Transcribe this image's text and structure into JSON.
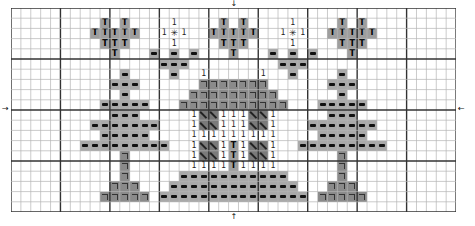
{
  "chart": {
    "cols": 45,
    "rows": 20,
    "cell_width": 9.89,
    "cell_height": 10.2,
    "major_every": 5,
    "center_col": 22,
    "center_row_line": 10,
    "colors": {
      "minor_line": "#b4b4b4",
      "major_line": "#333333",
      "dash_fill": "#a9a9a9",
      "bracket_fill": "#8a8a8a",
      "T_fill": "#9e9e9e",
      "diag_fill": "#7a7a7a"
    },
    "markers": {
      "top_arrow": "↓",
      "bottom_arrow": "↑",
      "left_arrow": "→",
      "right_arrow": "←"
    },
    "legend_symbols": {
      "dash": "−",
      "bracket": "¬",
      "T": "T",
      "diag": "\\",
      "one": "1",
      "star": "✳"
    },
    "stitches": [
      {
        "row": 1,
        "cols": [
          9,
          11
        ],
        "sym": "T"
      },
      {
        "row": 2,
        "cols": [
          8,
          9,
          10,
          11,
          12
        ],
        "sym": "T"
      },
      {
        "row": 3,
        "cols": [
          9,
          10,
          11
        ],
        "sym": "T"
      },
      {
        "row": 4,
        "cols": [
          10
        ],
        "sym": "T"
      },
      {
        "row": 1,
        "cols": [
          21,
          23
        ],
        "sym": "T"
      },
      {
        "row": 2,
        "cols": [
          20,
          21,
          22,
          23,
          24
        ],
        "sym": "T"
      },
      {
        "row": 3,
        "cols": [
          21,
          22,
          23
        ],
        "sym": "T"
      },
      {
        "row": 4,
        "cols": [
          22
        ],
        "sym": "T"
      },
      {
        "row": 1,
        "cols": [
          33,
          35
        ],
        "sym": "T"
      },
      {
        "row": 2,
        "cols": [
          32,
          33,
          34,
          35,
          36
        ],
        "sym": "T"
      },
      {
        "row": 3,
        "cols": [
          33,
          34,
          35
        ],
        "sym": "T"
      },
      {
        "row": 4,
        "cols": [
          34
        ],
        "sym": "T"
      },
      {
        "row": 1,
        "cols": [
          16,
          28
        ],
        "sym": "one"
      },
      {
        "row": 2,
        "cols": [
          15,
          17,
          27,
          29
        ],
        "sym": "one"
      },
      {
        "row": 2,
        "cols": [
          16,
          28
        ],
        "sym": "star"
      },
      {
        "row": 3,
        "cols": [
          16,
          28
        ],
        "sym": "one"
      },
      {
        "row": 4,
        "cols": [
          14,
          16,
          18,
          26,
          28,
          30
        ],
        "sym": "dash"
      },
      {
        "row": 5,
        "cols": [
          15,
          16,
          17,
          27,
          28,
          29
        ],
        "sym": "dash"
      },
      {
        "row": 6,
        "cols": [
          16,
          28
        ],
        "sym": "dash"
      },
      {
        "row": 6,
        "cols": [
          19,
          25
        ],
        "sym": "one"
      },
      {
        "row": 6,
        "cols": [
          11,
          33
        ],
        "sym": "dash"
      },
      {
        "row": 7,
        "cols": [
          10,
          11,
          12,
          32,
          33,
          34
        ],
        "sym": "dash"
      },
      {
        "row": 8,
        "cols": [
          11,
          33
        ],
        "sym": "dash"
      },
      {
        "row": 9,
        "cols": [
          9,
          10,
          11,
          12,
          13,
          31,
          32,
          33,
          34,
          35
        ],
        "sym": "dash"
      },
      {
        "row": 10,
        "cols": [
          10,
          11,
          12,
          32,
          33,
          34
        ],
        "sym": "dash"
      },
      {
        "row": 11,
        "cols": [
          8,
          9,
          10,
          11,
          12,
          13,
          14,
          30,
          31,
          32,
          33,
          34,
          35,
          36
        ],
        "sym": "dash"
      },
      {
        "row": 12,
        "cols": [
          9,
          10,
          11,
          12,
          13,
          31,
          32,
          33,
          34,
          35
        ],
        "sym": "dash"
      },
      {
        "row": 13,
        "cols": [
          7,
          8,
          9,
          10,
          11,
          12,
          13,
          14,
          15,
          29,
          30,
          31,
          32,
          33,
          34,
          35,
          36,
          37
        ],
        "sym": "dash"
      },
      {
        "row": 14,
        "cols": [
          11,
          33
        ],
        "sym": "bracket"
      },
      {
        "row": 15,
        "cols": [
          11,
          33
        ],
        "sym": "bracket"
      },
      {
        "row": 16,
        "cols": [
          11,
          33
        ],
        "sym": "bracket"
      },
      {
        "row": 17,
        "cols": [
          10,
          11,
          12,
          32,
          33,
          34
        ],
        "sym": "bracket"
      },
      {
        "row": 18,
        "cols": [
          9,
          10,
          11,
          12,
          13,
          31,
          32,
          33,
          34,
          35
        ],
        "sym": "bracket"
      },
      {
        "row": 7,
        "cols": [
          19,
          20,
          21,
          22,
          23,
          24,
          25
        ],
        "sym": "bracket"
      },
      {
        "row": 8,
        "cols": [
          18,
          19,
          20,
          21,
          22,
          23,
          24,
          25,
          26
        ],
        "sym": "bracket"
      },
      {
        "row": 9,
        "cols": [
          17,
          18,
          19,
          20,
          21,
          22,
          23,
          24,
          25,
          26,
          27
        ],
        "sym": "bracket"
      },
      {
        "row": 10,
        "cols": [
          18,
          21,
          22,
          23,
          26
        ],
        "sym": "one"
      },
      {
        "row": 10,
        "cols": [
          19,
          20,
          24,
          25
        ],
        "sym": "diag"
      },
      {
        "row": 11,
        "cols": [
          18,
          21,
          22,
          23,
          26
        ],
        "sym": "one"
      },
      {
        "row": 11,
        "cols": [
          19,
          20,
          24,
          25
        ],
        "sym": "diag"
      },
      {
        "row": 12,
        "cols": [
          18,
          19,
          20,
          21,
          22,
          23,
          24,
          25,
          26
        ],
        "sym": "one"
      },
      {
        "row": 13,
        "cols": [
          18,
          21,
          23,
          26
        ],
        "sym": "one"
      },
      {
        "row": 13,
        "cols": [
          19,
          20,
          24,
          25
        ],
        "sym": "diag"
      },
      {
        "row": 13,
        "cols": [
          22
        ],
        "sym": "T"
      },
      {
        "row": 14,
        "cols": [
          18,
          21,
          23,
          26
        ],
        "sym": "one"
      },
      {
        "row": 14,
        "cols": [
          19,
          20,
          24,
          25
        ],
        "sym": "diag"
      },
      {
        "row": 14,
        "cols": [
          22
        ],
        "sym": "T"
      },
      {
        "row": 15,
        "cols": [
          18,
          19,
          20,
          21,
          23,
          24,
          25,
          26
        ],
        "sym": "one"
      },
      {
        "row": 15,
        "cols": [
          22
        ],
        "sym": "T"
      },
      {
        "row": 16,
        "cols": [
          17,
          18,
          19,
          20,
          21,
          22,
          23,
          24,
          25,
          26,
          27
        ],
        "sym": "dash"
      },
      {
        "row": 17,
        "cols": [
          16,
          17,
          18,
          19,
          20,
          21,
          22,
          23,
          24,
          25,
          26,
          27,
          28
        ],
        "sym": "dash"
      },
      {
        "row": 18,
        "cols": [
          15,
          16,
          17,
          18,
          19,
          20,
          21,
          22,
          23,
          24,
          25,
          26,
          27,
          28,
          29
        ],
        "sym": "dash"
      }
    ]
  }
}
